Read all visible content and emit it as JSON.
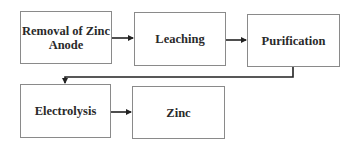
{
  "diagram": {
    "type": "flowchart",
    "title": "",
    "nodes": [
      {
        "id": "n1",
        "label": "Removal of Zinc Anode"
      },
      {
        "id": "n2",
        "label": "Leaching"
      },
      {
        "id": "n3",
        "label": "Purification"
      },
      {
        "id": "n4",
        "label": "Electrolysis"
      },
      {
        "id": "n5",
        "label": "Zinc"
      }
    ],
    "edges": [
      {
        "from": "n1",
        "to": "n2"
      },
      {
        "from": "n2",
        "to": "n3"
      },
      {
        "from": "n3",
        "to": "n4"
      },
      {
        "from": "n4",
        "to": "n5"
      }
    ],
    "colors": {
      "box_border": "#8a8a8a",
      "arrow": "#222222",
      "text": "#2a2a2a",
      "background": "#ffffff"
    }
  }
}
